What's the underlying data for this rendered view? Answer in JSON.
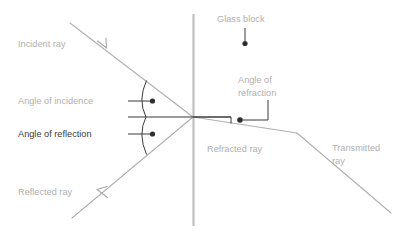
{
  "diagram": {
    "colors": {
      "light_gray": "#b0b0b0",
      "dark_gray": "#3a3a3a",
      "glass_line": "#bdbdbd",
      "background": "#ffffff"
    },
    "labels": {
      "incident_ray": "Incident ray",
      "angle_of_incidence": "Angle of incidence",
      "angle_of_reflection": "Angle of reflection",
      "reflected_ray": "Reflected ray",
      "glass_block": "Glass block",
      "angle_of_refraction_line1": "Angle of",
      "angle_of_refraction_line2": "refraction",
      "refracted_ray": "Refracted ray",
      "transmitted_ray_line1": "Transmitted",
      "transmitted_ray_line2": "ray"
    },
    "geometry": {
      "intersection_x": 193,
      "intersection_y": 117,
      "glass_surface_top_y": 14,
      "glass_surface_bottom_y": 226,
      "incident_start_x": 70,
      "incident_start_y": 23,
      "reflected_end_x": 72,
      "reflected_end_y": 218,
      "refraction_bend_x": 297,
      "refraction_bend_y": 133,
      "transmitted_end_x": 391,
      "transmitted_end_y": 213,
      "normal_start_x": 128,
      "normal_end_x": 300
    }
  }
}
